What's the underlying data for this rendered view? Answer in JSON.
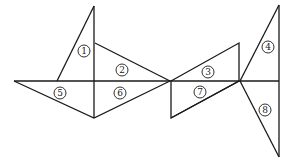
{
  "figure": {
    "type": "tangram-like triangle composition",
    "labels": [
      "1",
      "2",
      "3",
      "4",
      "5",
      "6",
      "7",
      "8"
    ],
    "stroke_color": "#1a1a1a",
    "background": "#ffffff"
  }
}
